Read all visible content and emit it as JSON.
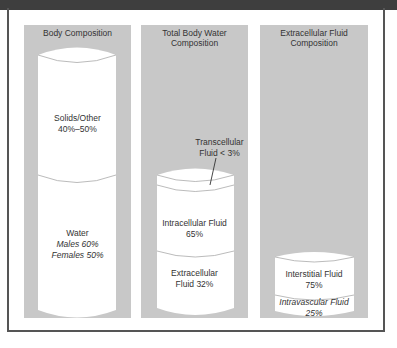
{
  "panels": [
    {
      "title": "Body Composition",
      "segments": [
        {
          "label": "Solids/Other",
          "value": "40%–50%"
        },
        {
          "label": "Water",
          "males": "Males 60%",
          "females": "Females 50%"
        }
      ]
    },
    {
      "title_line1": "Total Body Water",
      "title_line2": "Composition",
      "callout": {
        "line1": "Transcellular",
        "line2": "Fluid < 3%"
      },
      "segments": [
        {
          "label": "Intracellular Fluid",
          "value": "65%"
        },
        {
          "label": "Extracellular",
          "value": "Fluid 32%"
        }
      ]
    },
    {
      "title_line1": "Extracellular Fluid",
      "title_line2": "Composition",
      "segments": [
        {
          "label": "Interstitial Fluid",
          "value": "75%"
        },
        {
          "label": "Intravascular Fluid",
          "value": "25%"
        }
      ]
    }
  ],
  "colors": {
    "panel": "#c8c8c8",
    "cylinder": "#ffffff",
    "outline": "#999999",
    "topbar": "#3e3e3e"
  }
}
